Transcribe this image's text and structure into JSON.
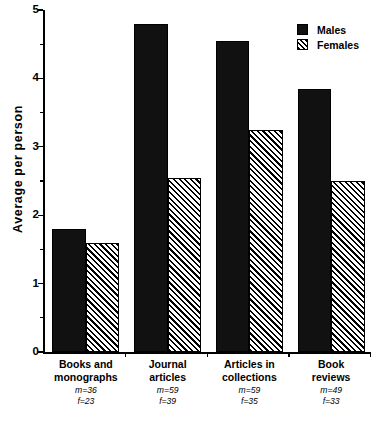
{
  "chart_data": {
    "type": "bar",
    "title": "",
    "xlabel": "",
    "ylabel": "Average  per  person",
    "ylim": [
      0,
      5
    ],
    "ytick_values": [
      0,
      1,
      2,
      3,
      4,
      5
    ],
    "ytick_labels": [
      "0",
      "1",
      "2",
      "3",
      "4",
      "5"
    ],
    "yminor_values": [
      0.5,
      1.5,
      2.5,
      3.5,
      4.5
    ],
    "grid": false,
    "legend_position": "top-right",
    "categories": [
      "Books and monographs",
      "Journal articles",
      "Articles in collections",
      "Book reviews"
    ],
    "category_lines": [
      [
        "Books and",
        "monographs"
      ],
      [
        "Journal",
        "articles"
      ],
      [
        "Articles in",
        "collections"
      ],
      [
        "Book",
        "reviews"
      ]
    ],
    "category_counts": [
      [
        "m=36",
        "f=23"
      ],
      [
        "m=59",
        "f=39"
      ],
      [
        "m=59",
        "f=35"
      ],
      [
        "m=49",
        "f=33"
      ]
    ],
    "series": [
      {
        "name": "Males",
        "values": [
          1.8,
          4.8,
          4.55,
          3.85
        ],
        "fill": "solid",
        "color": "#111111"
      },
      {
        "name": "Females",
        "values": [
          1.6,
          2.55,
          3.25,
          2.5
        ],
        "fill": "hatch",
        "color": "#000000"
      }
    ]
  },
  "legend": {
    "items": [
      {
        "label": "Males",
        "swatch": "solid-black-square"
      },
      {
        "label": "Females",
        "swatch": "hatched-square"
      }
    ]
  },
  "axis": {
    "y_title": "Average  per  person"
  }
}
